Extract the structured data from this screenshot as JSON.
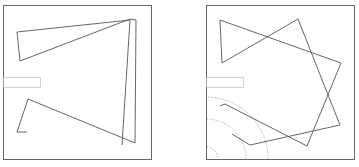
{
  "figure": {
    "panels": [
      {
        "name": "left-panel",
        "frame": {
          "x": 3,
          "y": 5,
          "w": 148,
          "h": 154
        },
        "entrance": {
          "x": 3,
          "y": 77,
          "w": 37,
          "h": 10
        },
        "path": "M27,132 L17,132 L28,99 L135,143 L136,20 L130,19 L20,61 L17,32 L130,20 L122,145",
        "arcs": []
      },
      {
        "name": "right-panel",
        "frame": {
          "x": 206,
          "y": 5,
          "w": 148,
          "h": 154
        },
        "entrance": {
          "x": 206,
          "y": 77,
          "w": 37,
          "h": 10
        },
        "path": "M232,134 L250,145 L340,125 L298,19 L222,63 L220,20 L341,63 L307,146 L225,104 L220,106",
        "arcs": [
          {
            "cx": 206,
            "cy": 159,
            "r": 12
          },
          {
            "cx": 206,
            "cy": 159,
            "r": 40
          },
          {
            "cx": 206,
            "cy": 159,
            "r": 62
          }
        ]
      }
    ],
    "colors": {
      "line": "#555555",
      "frame": "#666666",
      "dotted": "#888888",
      "arc": "#999999",
      "background": "#ffffff"
    }
  }
}
